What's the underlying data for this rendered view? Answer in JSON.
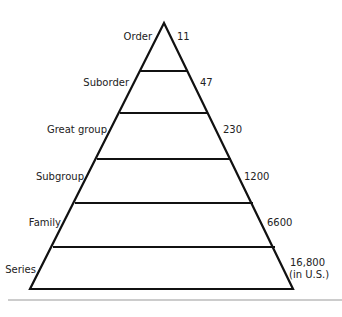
{
  "diagram": {
    "title": "",
    "levels": [
      {
        "name": "Order",
        "count": "11"
      },
      {
        "name": "Suborder",
        "count": "47"
      },
      {
        "name": "Great group",
        "count": "230"
      },
      {
        "name": "Subgroup",
        "count": "1200"
      },
      {
        "name": "Family",
        "count": "6600"
      },
      {
        "name": "Series",
        "count": "16,800",
        "count_note": "(in U.S.)"
      }
    ],
    "colors": {
      "stroke": "#111111",
      "rule": "#9a9a9a",
      "background": "#ffffff"
    }
  }
}
